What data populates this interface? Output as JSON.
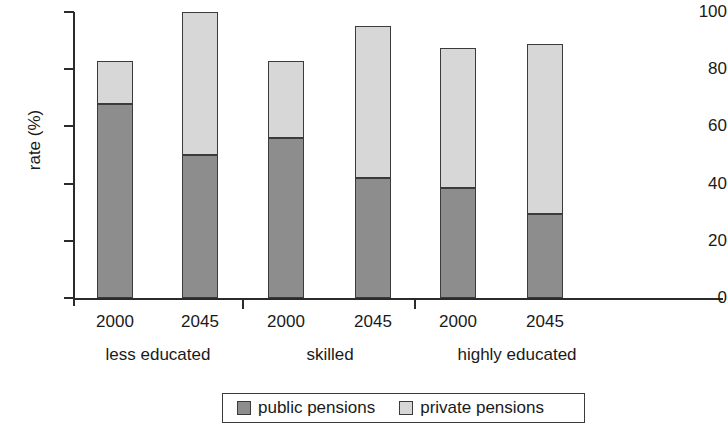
{
  "chart_data": {
    "type": "bar",
    "subtype": "stacked-bar",
    "title": "",
    "xlabel": "",
    "ylabel": "rate (%)",
    "ylim": [
      0,
      100
    ],
    "yticks": [
      0,
      20,
      40,
      60,
      80,
      100
    ],
    "ytick_labels": [
      "0",
      "20",
      "40",
      "60",
      "80",
      "100"
    ],
    "grid": false,
    "legend_position": "bottom",
    "categories": [
      "2000",
      "2045",
      "2000",
      "2045",
      "2000",
      "2045"
    ],
    "groups": [
      {
        "label": "less educated",
        "categories": [
          "2000",
          "2045"
        ]
      },
      {
        "label": "skilled",
        "categories": [
          "2000",
          "2045"
        ]
      },
      {
        "label": "highly educated",
        "categories": [
          "2000",
          "2045"
        ]
      }
    ],
    "series": [
      {
        "name": "public pensions",
        "color": "#8d8d8d",
        "values": [
          68,
          50,
          56,
          42,
          38.5,
          29.5
        ]
      },
      {
        "name": "private pensions",
        "color": "#d7d7d7",
        "values": [
          15,
          50,
          27,
          53,
          49,
          59.2
        ]
      }
    ],
    "totals": [
      83,
      100,
      83,
      95,
      87.5,
      88.7
    ],
    "bars": [
      {
        "group": "less educated",
        "category": "2000",
        "public": 68,
        "private": 15,
        "total": 83
      },
      {
        "group": "less educated",
        "category": "2045",
        "public": 50,
        "private": 50,
        "total": 100
      },
      {
        "group": "skilled",
        "category": "2000",
        "public": 56,
        "private": 27,
        "total": 83
      },
      {
        "group": "skilled",
        "category": "2045",
        "public": 42,
        "private": 53,
        "total": 95
      },
      {
        "group": "highly educated",
        "category": "2000",
        "public": 38.5,
        "private": 49,
        "total": 87.5
      },
      {
        "group": "highly educated",
        "category": "2045",
        "public": 29.5,
        "private": 59.2,
        "total": 88.7
      }
    ]
  },
  "axis": {
    "ylabel": "rate (%)",
    "ytick_labels": [
      "100",
      "80",
      "60",
      "40",
      "20",
      "0"
    ],
    "xtick_labels": [
      "2000",
      "2045",
      "2000",
      "2045",
      "2000",
      "2045"
    ],
    "group_labels": [
      "less educated",
      "skilled",
      "highly educated"
    ]
  },
  "legend": {
    "items": [
      {
        "label": "public pensions",
        "color": "#8d8d8d"
      },
      {
        "label": "private pensions",
        "color": "#d7d7d7"
      }
    ]
  },
  "colors": {
    "public": "#8d8d8d",
    "private": "#d7d7d7",
    "axis": "#2b2b2b",
    "bar_border": "#3b3b3b",
    "background": "#ffffff"
  }
}
